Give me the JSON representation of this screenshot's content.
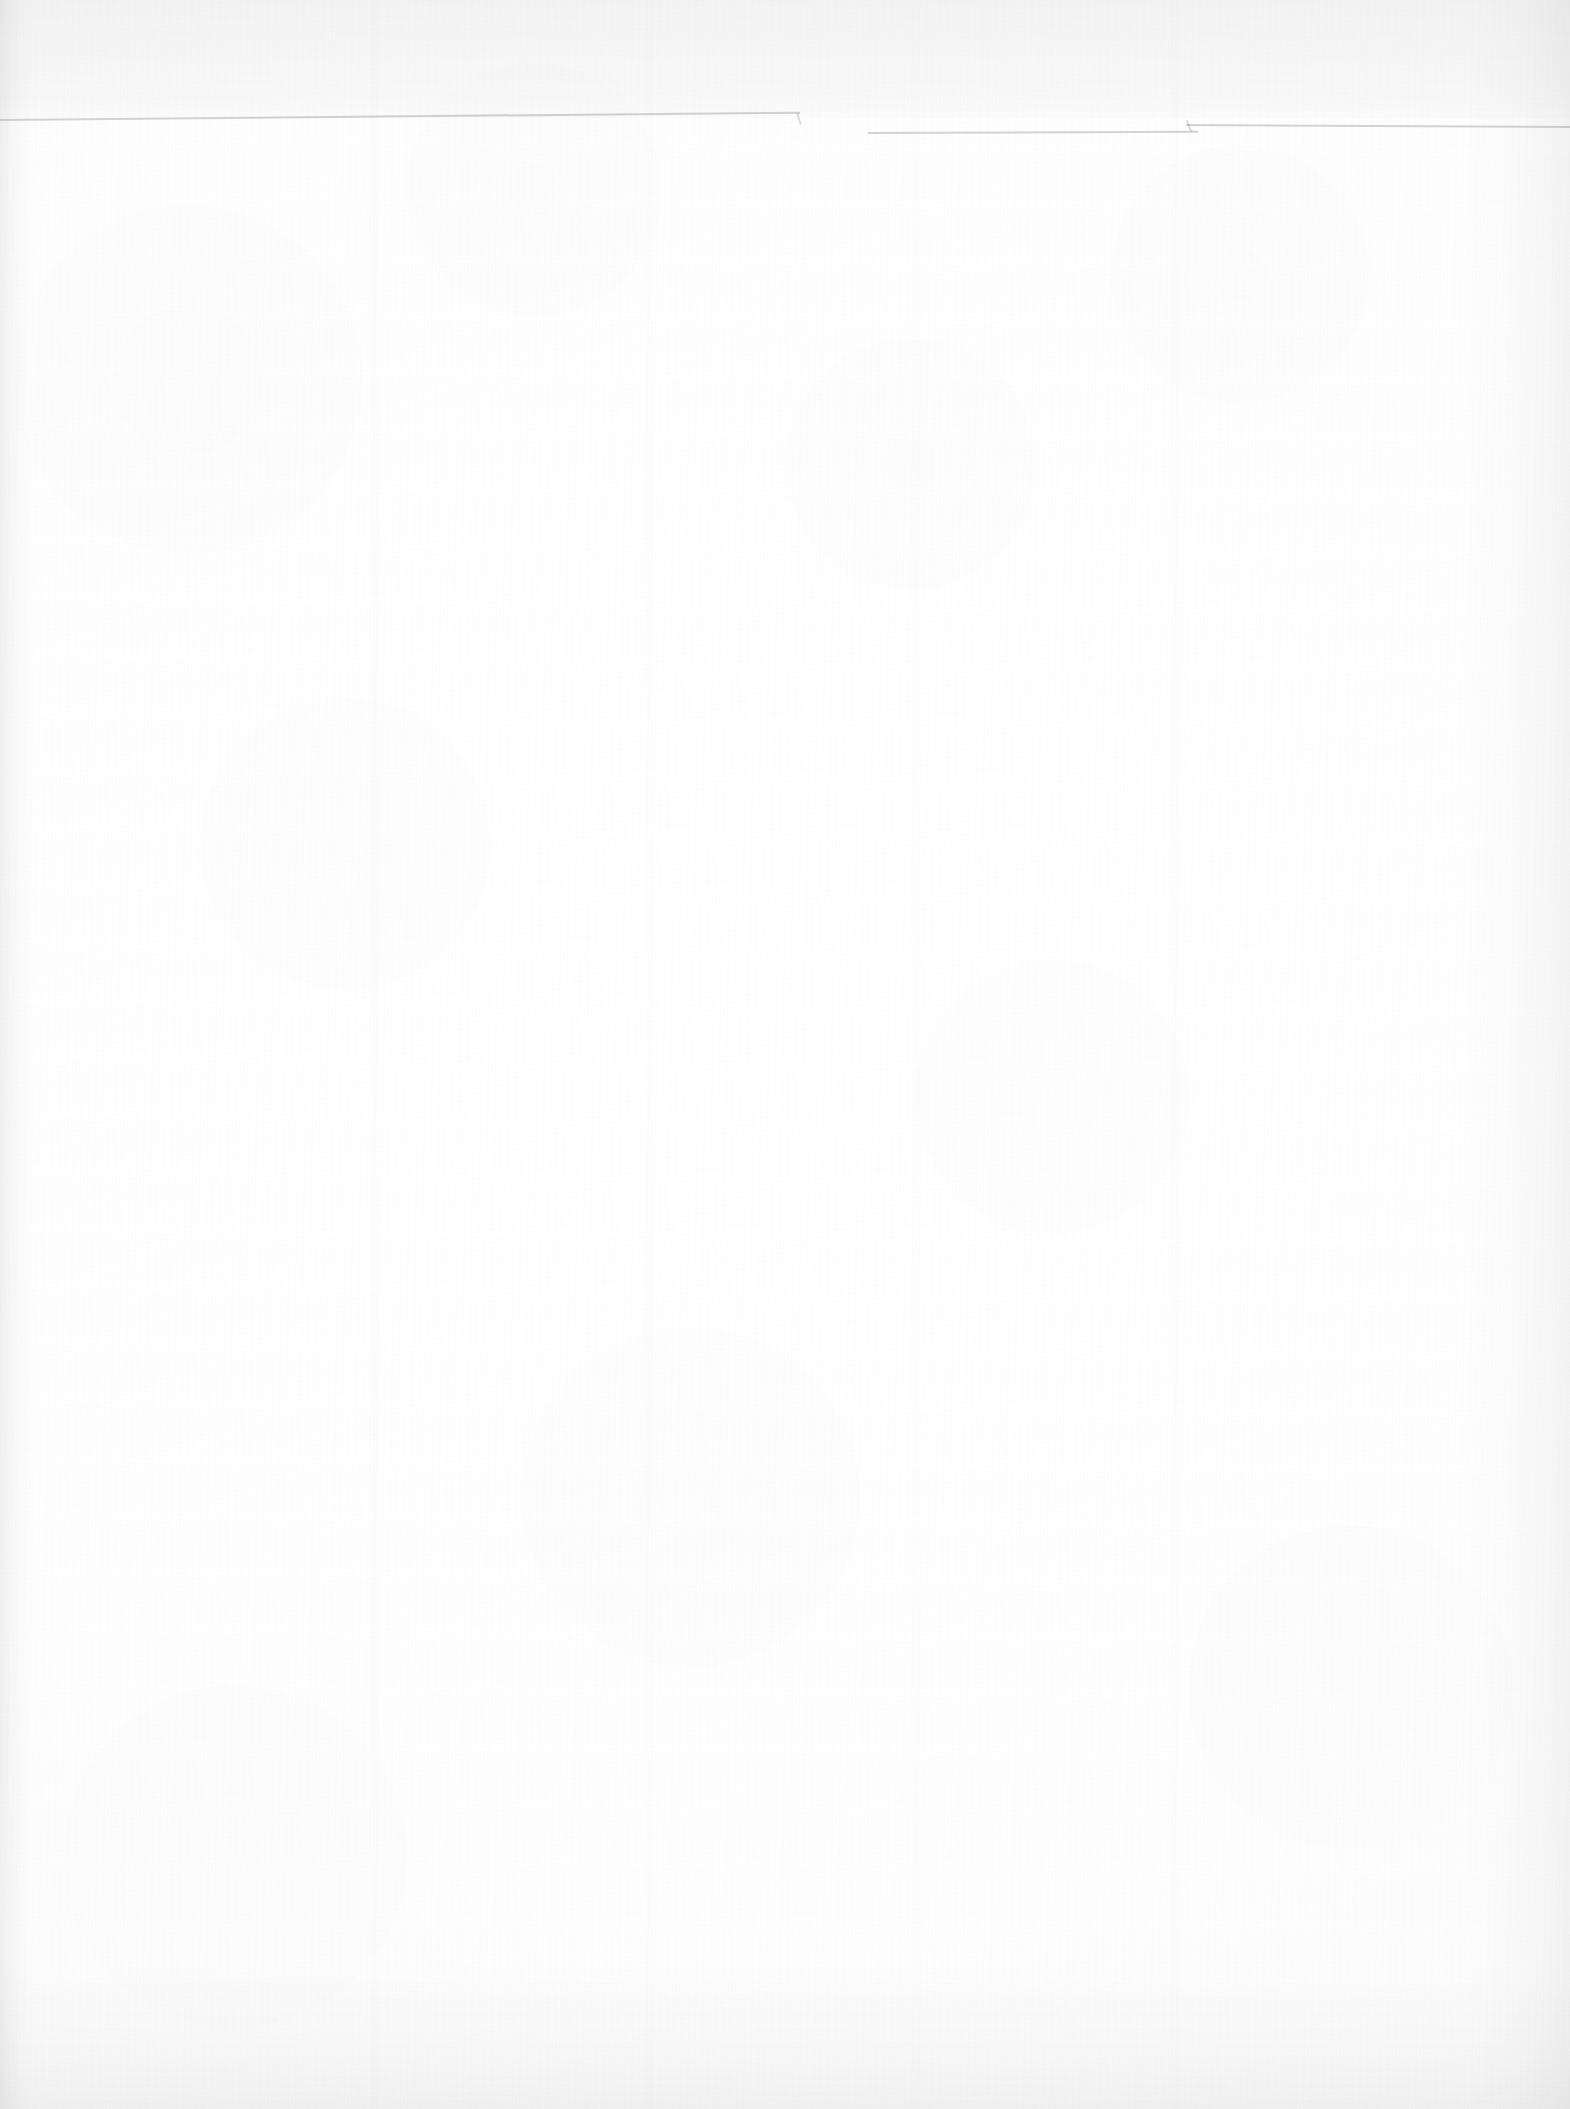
{
  "document": {
    "kind": "scanned-page",
    "surface": "blank verso",
    "page_width_px": 1570,
    "page_height_px": 2109,
    "paper_color": "#fefefe",
    "background_color": "#ffffff",
    "visible_text": "",
    "notes_label": ""
  },
  "page_edge": {
    "line_color": "#2b2b2b",
    "line_opacity": "0.17",
    "segments": [
      {
        "label": "left-segment"
      },
      {
        "label": "middle-segment"
      },
      {
        "label": "right-segment"
      }
    ]
  },
  "ghost_text": {
    "description": "show-through bleed from the reverse printed side",
    "opacity": "0.04",
    "lines": [
      {
        "size": "small",
        "text": ""
      },
      {
        "size": "large",
        "text": ""
      }
    ]
  },
  "shading": {
    "left_edge": "rgba(0,0,0,0.055)",
    "right_edge": "rgba(0,0,0,0.042)",
    "top_edge": "rgba(0,0,0,0.030)",
    "bottom_edge": "rgba(0,0,0,0.052)"
  }
}
